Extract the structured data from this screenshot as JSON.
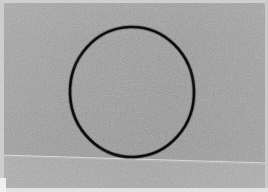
{
  "scene": {
    "kind": "photograph",
    "subject": "hand-drawn dark circle on a flat gray surface",
    "width": 268,
    "height": 192,
    "caption": ""
  },
  "colors": {
    "surface_upper": "#9b9b9b",
    "surface_lower": "#a6a6a6",
    "circle_stroke": "#141414",
    "seam_line": "#dcdcdc",
    "border_strip": "#cfcfcf",
    "border_bottom": "#e3e3e3",
    "page_background": "#ffffff"
  },
  "elements": {
    "circle": {
      "label": "drawn-circle",
      "center_x": 132,
      "center_y": 92,
      "radius_x": 62,
      "radius_y": 65,
      "stroke_width": 2.6,
      "stroke_color": "#141414",
      "fill": "none",
      "rotation_deg": -2
    },
    "seam_line": {
      "label": "horizon-seam",
      "x1": 0,
      "y1": 155,
      "x2": 268,
      "y2": 163,
      "stroke_width": 1.1,
      "stroke_color": "#dcdcdc"
    },
    "borders": [
      {
        "label": "top-edge-strip",
        "thickness": 3
      },
      {
        "label": "left-edge-strip",
        "thickness": 4
      },
      {
        "label": "right-edge-strip",
        "thickness": 3
      },
      {
        "label": "bottom-edge-strip",
        "thickness": 4
      }
    ]
  },
  "grain": {
    "label": "film-grain-noise",
    "opacity": 0.5,
    "base_frequency": 0.82,
    "octaves": 3
  }
}
